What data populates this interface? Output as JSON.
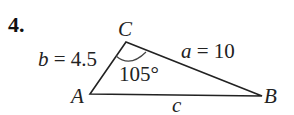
{
  "problem": {
    "number": "4.",
    "vertices": {
      "A": "A",
      "B": "B",
      "C": "C"
    },
    "side_b": {
      "var": "b",
      "eq": " = 4.5"
    },
    "side_a": {
      "var": "a",
      "eq": " = 10"
    },
    "side_c": {
      "var": "c"
    },
    "angle_C": "105°"
  }
}
